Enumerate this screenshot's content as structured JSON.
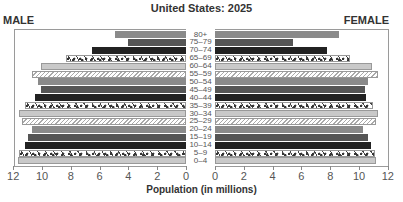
{
  "header": {
    "title": "United States: 2025",
    "male_label": "MALE",
    "female_label": "FEMALE"
  },
  "axis": {
    "xlabel": "Population (in millions)",
    "male_ticks": [
      "12",
      "10",
      "8",
      "6",
      "4",
      "2",
      "0"
    ],
    "female_ticks": [
      "0",
      "2",
      "4",
      "6",
      "8",
      "10",
      "12"
    ]
  },
  "chart_data": {
    "type": "bar",
    "subtype": "population-pyramid",
    "title": "United States: 2025",
    "xlabel": "Population (in millions)",
    "ylabel": "Age group",
    "xlim": [
      0,
      12
    ],
    "grid": false,
    "legend_position": "top (MALE left, FEMALE right)",
    "categories": [
      "80+",
      "75–79",
      "70–74",
      "65–69",
      "60–64",
      "55–59",
      "50–54",
      "45–49",
      "40–44",
      "35–39",
      "30–34",
      "25–29",
      "20–24",
      "15–19",
      "10–14",
      "5–9",
      "0–4"
    ],
    "series": [
      {
        "name": "MALE",
        "values": [
          4.9,
          4.0,
          6.5,
          8.3,
          10.1,
          10.7,
          10.3,
          10.1,
          10.5,
          11.2,
          11.6,
          11.4,
          10.7,
          11.0,
          11.2,
          11.6,
          11.7
        ]
      },
      {
        "name": "FEMALE",
        "values": [
          8.6,
          5.4,
          7.8,
          9.4,
          10.9,
          11.3,
          10.6,
          10.4,
          10.5,
          11.0,
          11.3,
          11.2,
          10.3,
          10.6,
          10.8,
          11.1,
          11.2
        ]
      }
    ],
    "fills": [
      "mid",
      "darkmid",
      "dark",
      "speckle",
      "light",
      "hatch",
      "mid",
      "darkmid",
      "dark",
      "speckle",
      "light",
      "hatch",
      "mid",
      "darkmid",
      "dark",
      "speckle",
      "light"
    ]
  }
}
